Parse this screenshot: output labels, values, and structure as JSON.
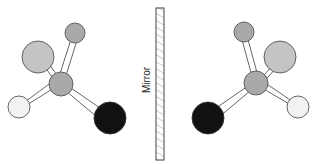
{
  "diagram": {
    "mirror_label": "Mirror",
    "colors": {
      "mirror_stroke": "#444444",
      "hatch": "#888888",
      "bond": "#555555",
      "atom_stroke": "#555555",
      "central_atom": "#a9a9a9",
      "top_atom": "#a9a9a9",
      "large_atom": "#c4c4c4",
      "white_atom": "#f2f2f2",
      "black_atom": "#111111"
    },
    "molecules": [
      {
        "name": "left-molecule",
        "atoms": [
          "central",
          "top-small-gray",
          "large-light-gray",
          "white",
          "black"
        ]
      },
      {
        "name": "right-molecule",
        "atoms": [
          "central",
          "top-small-gray",
          "large-light-gray",
          "white",
          "black"
        ]
      }
    ]
  }
}
